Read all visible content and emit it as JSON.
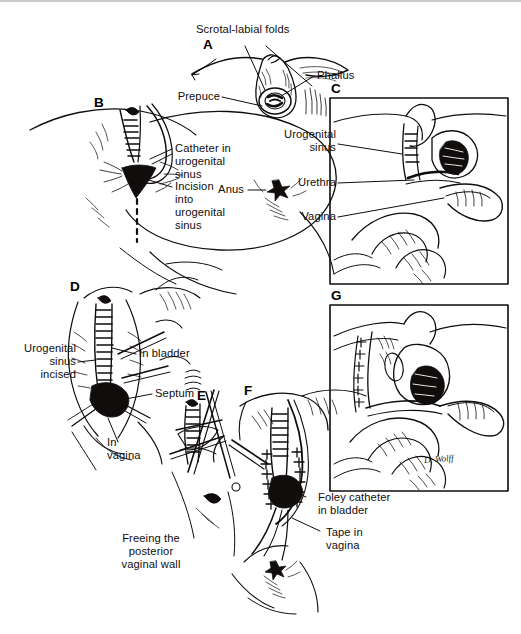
{
  "figure": {
    "ink_color": "#100d0c",
    "background_color": "#ffffff",
    "signature": "D. Wolff"
  },
  "panels": [
    {
      "id": "A",
      "letter": "A"
    },
    {
      "id": "B",
      "letter": "B"
    },
    {
      "id": "C",
      "letter": "C",
      "framed": true
    },
    {
      "id": "D",
      "letter": "D"
    },
    {
      "id": "E",
      "letter": "E"
    },
    {
      "id": "F",
      "letter": "F"
    },
    {
      "id": "G",
      "letter": "G",
      "framed": true
    }
  ],
  "labels": {
    "scrotal_labial_folds": "Scrotal-labial folds",
    "phallus": "Phallus",
    "prepuce": "Prepuce",
    "catheter_in_urogenital_sinus": "Catheter in\nurogenital\nsinus",
    "incision_into_urogenital_sinus": "Incision\ninto\nurogenital\nsinus",
    "anus": "Anus",
    "urogenital_sinus": "Urogenital\nsinus",
    "urethra": "Urethra",
    "vagina": "Vagina",
    "urogenital_sinus_incised": "Urogenital\nsinus\nincised",
    "in_bladder": "In bladder",
    "septum": "Septum",
    "in_vagina": "In\nvagina",
    "freeing_posterior_vaginal_wall": "Freeing the\nposterior\nvaginal wall",
    "foley_catheter_in_bladder": "Foley catheter\nin bladder",
    "tape_in_vagina": "Tape in\nvagina"
  }
}
